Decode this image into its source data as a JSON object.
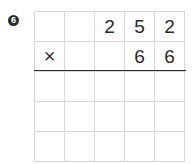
{
  "problem_number": "6",
  "multiplicand_row": [
    "",
    "",
    "2",
    "5",
    "2"
  ],
  "multiplier_row": [
    "×",
    "",
    "",
    "6",
    "6"
  ],
  "answer_rows": [
    [
      "",
      "",
      "",
      "",
      ""
    ],
    [
      "",
      "",
      "",
      "",
      ""
    ],
    [
      "",
      "",
      "",
      "",
      ""
    ]
  ]
}
